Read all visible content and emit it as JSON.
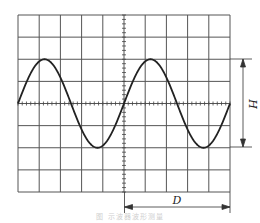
{
  "figure": {
    "type": "oscilloscope-waveform",
    "grid": {
      "columns": 10,
      "rows": 8,
      "left": 18,
      "top": 15,
      "right": 230,
      "bottom": 192
    },
    "waveform": {
      "shape": "sine",
      "periods_visible": 2,
      "divisions_per_period": 5,
      "amplitude_divisions": 2
    },
    "labels": {
      "height_label": "H",
      "period_label": "D"
    },
    "caption": "图    示波器波形测量",
    "colors": {
      "line": "#333333",
      "grid": "#555555",
      "background": "#ffffff"
    }
  }
}
